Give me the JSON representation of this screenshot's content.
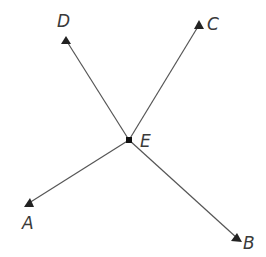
{
  "diagram": {
    "type": "rays-from-point",
    "center": {
      "label": "E",
      "x": 129,
      "y": 140
    },
    "rays": [
      {
        "label": "A",
        "tip": {
          "x": 29,
          "y": 203
        },
        "label_pos": {
          "x": 22,
          "y": 229
        }
      },
      {
        "label": "B",
        "tip": {
          "x": 237,
          "y": 238
        },
        "label_pos": {
          "x": 243,
          "y": 249
        }
      },
      {
        "label": "C",
        "tip": {
          "x": 199,
          "y": 25
        },
        "label_pos": {
          "x": 207,
          "y": 30
        }
      },
      {
        "label": "D",
        "tip": {
          "x": 66,
          "y": 40
        },
        "label_pos": {
          "x": 57,
          "y": 27
        }
      }
    ],
    "center_label_pos": {
      "x": 140,
      "y": 147
    },
    "colors": {
      "line": "#555555",
      "arrow": "#222222",
      "dot": "#111111",
      "text": "#3a3a3a"
    }
  }
}
